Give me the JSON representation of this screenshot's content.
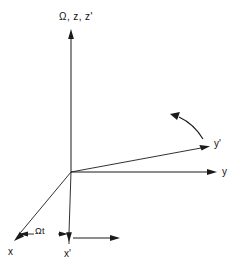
{
  "figure": {
    "background_color": "#ffffff",
    "line_color": "#1a1a1a",
    "width": 244,
    "height": 271
  },
  "labels": {
    "vertical_axis": "Ω, z, z'",
    "y_axis": "y",
    "y_prime_axis": "y'",
    "x_axis": "x",
    "x_prime_axis": "x'",
    "angle": "Ωt"
  },
  "geometry": {
    "origin": {
      "x": 71,
      "y": 172
    },
    "axes": [
      {
        "name": "z",
        "from": [
          71,
          172
        ],
        "to": [
          71,
          33
        ],
        "arrow": true
      },
      {
        "name": "y",
        "from": [
          71,
          172
        ],
        "to": [
          213,
          172
        ],
        "arrow": true
      },
      {
        "name": "y-prime",
        "from": [
          71,
          172
        ],
        "to": [
          206,
          147
        ],
        "arrow": true
      },
      {
        "name": "x",
        "from": [
          71,
          172
        ],
        "to": [
          16,
          238
        ],
        "arrow": true
      },
      {
        "name": "x-prime",
        "from": [
          71,
          172
        ],
        "to": [
          69,
          239
        ],
        "arrow": true
      }
    ],
    "rotation_arc": {
      "name": "rotation-direction-arc",
      "from": [
        202,
        138
      ],
      "to": [
        172,
        118
      ],
      "arrow": true
    },
    "angle_markers": {
      "left_arrow_to": [
        25,
        234
      ],
      "right_arrow_to": [
        66,
        234
      ],
      "baseline_y": 234
    },
    "x_prime_horizontal_arrow": {
      "from": [
        75,
        238
      ],
      "to": [
        118,
        238
      ],
      "arrow": true
    }
  }
}
